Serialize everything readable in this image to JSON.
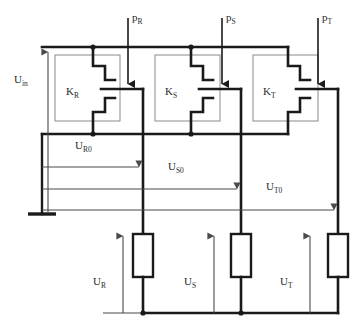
{
  "diagram": {
    "type": "electrical-schematic",
    "colors": {
      "heavy_wire": "#1a1a1a",
      "light_wire": "#6b6b6b",
      "box_outline": "#8a8a8a",
      "text": "#2b2b2b",
      "background": "#ffffff"
    },
    "labels": {
      "supply": {
        "base": "U",
        "sub": "in"
      },
      "control_inputs": [
        {
          "base": "p",
          "sub": "R"
        },
        {
          "base": "p",
          "sub": "S"
        },
        {
          "base": "p",
          "sub": "T"
        }
      ],
      "switches": [
        {
          "base": "K",
          "sub": "R"
        },
        {
          "base": "K",
          "sub": "S"
        },
        {
          "base": "K",
          "sub": "T"
        }
      ],
      "node_voltages": [
        {
          "base": "U",
          "sub": "R0"
        },
        {
          "base": "U",
          "sub": "S0"
        },
        {
          "base": "U",
          "sub": "T0"
        }
      ],
      "load_voltages": [
        {
          "base": "U",
          "sub": "R"
        },
        {
          "base": "U",
          "sub": "S"
        },
        {
          "base": "U",
          "sub": "T"
        }
      ]
    },
    "components": {
      "switch_blocks": 3,
      "resistors": 3,
      "ground_symbols": 1,
      "measurement_arrows": 7
    }
  }
}
